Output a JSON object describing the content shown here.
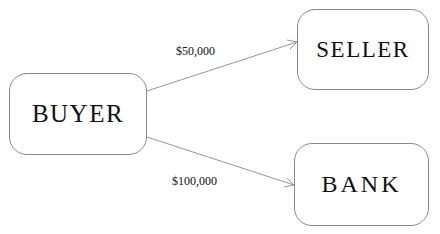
{
  "diagram": {
    "top_fragment": "",
    "nodes": [
      {
        "id": "buyer",
        "label": "BUYER"
      },
      {
        "id": "seller",
        "label": "SELLER"
      },
      {
        "id": "bank",
        "label": "BANK"
      }
    ],
    "edges": [
      {
        "from": "buyer",
        "to": "seller",
        "label": "$50,000"
      },
      {
        "from": "buyer",
        "to": "bank",
        "label": "$100,000"
      }
    ],
    "colors": {
      "stroke": "#8a8a8a",
      "text": "#111111",
      "background": "#ffffff"
    }
  }
}
